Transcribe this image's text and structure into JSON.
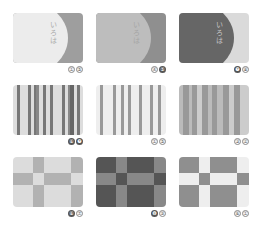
{
  "cards": [
    {
      "type": "split",
      "text": "いろは",
      "base_color": "#9e9e9e",
      "bulge_color": "#ececec",
      "text_color": "#aaaaaa",
      "label": [
        "①",
        "⑤"
      ],
      "label_style": [
        "outline",
        "outline"
      ]
    },
    {
      "type": "split",
      "text": "いろは",
      "base_color": "#8f8f8f",
      "bulge_color": "#bdbdbd",
      "text_color": "#a5a5a5",
      "label": [
        "④",
        "⑤"
      ],
      "label_style": [
        "outline",
        "filled"
      ]
    },
    {
      "type": "split",
      "text": "いろは",
      "base_color": "#dadada",
      "bulge_color": "#666666",
      "text_color": "#c8c8c8",
      "label": [
        "❼",
        "⑧"
      ],
      "label_style": [
        "filled",
        "outline"
      ]
    },
    {
      "type": "stripes",
      "colors": [
        "#ddd",
        "#777",
        "#ddd",
        "#777",
        "#ddd",
        "#777",
        "#888",
        "#ddd",
        "#777",
        "#ddd",
        "#777",
        "#ddd",
        "#777",
        "#ddd",
        "#888",
        "#666",
        "#ddd",
        "#777",
        "#ddd"
      ],
      "widths": [
        4,
        3,
        9,
        3,
        3,
        2,
        3,
        4,
        3,
        5,
        3,
        9,
        3,
        3,
        2,
        5,
        3,
        3,
        3
      ],
      "label": [
        "⑥",
        "❼"
      ],
      "label_style": [
        "filled",
        "filled"
      ]
    },
    {
      "type": "stripes",
      "colors": [
        "#eee",
        "#999",
        "#eee",
        "#999",
        "#eee",
        "#999",
        "#eee",
        "#999",
        "#eee",
        "#999",
        "#eee",
        "#999",
        "#eee",
        "#999",
        "#eee"
      ],
      "widths": [
        4,
        3,
        10,
        3,
        5,
        3,
        5,
        3,
        8,
        3,
        8,
        3,
        5,
        3,
        5
      ],
      "label": [
        "①",
        "⑤"
      ],
      "label_style": [
        "outline",
        "outline"
      ]
    },
    {
      "type": "stripes",
      "colors": [
        "#bbb",
        "#999",
        "#bbb",
        "#999",
        "#ccc",
        "#999",
        "#bbb",
        "#999",
        "#bbb",
        "#999",
        "#ccc",
        "#999",
        "#ccc"
      ],
      "widths": [
        4,
        6,
        3,
        5,
        5,
        6,
        4,
        5,
        6,
        6,
        5,
        6,
        9
      ],
      "label": [
        "③",
        "②"
      ],
      "label_style": [
        "outline",
        "outline"
      ]
    },
    {
      "type": "checks",
      "cols": [
        20,
        11,
        27,
        12
      ],
      "rows": [
        16,
        12,
        22
      ],
      "colors": [
        [
          "#dcdcdc",
          "#b2b2b2",
          "#dcdcdc",
          "#b2b2b2"
        ],
        [
          "#b2b2b2",
          "#dcdcdc",
          "#b2b2b2",
          "#dcdcdc"
        ],
        [
          "#dcdcdc",
          "#b2b2b2",
          "#dcdcdc",
          "#b2b2b2"
        ]
      ],
      "label": [
        "⑥",
        "⑦"
      ],
      "label_style": [
        "filled",
        "outline"
      ]
    },
    {
      "type": "checks",
      "cols": [
        20,
        11,
        27,
        12
      ],
      "rows": [
        16,
        12,
        22
      ],
      "colors": [
        [
          "#555",
          "#888",
          "#555",
          "#888"
        ],
        [
          "#888",
          "#555",
          "#888",
          "#555"
        ],
        [
          "#555",
          "#888",
          "#555",
          "#888"
        ]
      ],
      "label": [
        "❽",
        "⑨"
      ],
      "label_style": [
        "filled",
        "outline"
      ]
    },
    {
      "type": "checks",
      "cols": [
        20,
        11,
        27,
        12
      ],
      "rows": [
        16,
        12,
        22
      ],
      "colors": [
        [
          "#8f8f8f",
          "#eeeeee",
          "#8f8f8f",
          "#eeeeee"
        ],
        [
          "#eeeeee",
          "#8f8f8f",
          "#eeeeee",
          "#8f8f8f"
        ],
        [
          "#8f8f8f",
          "#eeeeee",
          "#8f8f8f",
          "#eeeeee"
        ]
      ],
      "label": [
        "⑥",
        "①"
      ],
      "label_style": [
        "outline",
        "outline"
      ]
    }
  ]
}
